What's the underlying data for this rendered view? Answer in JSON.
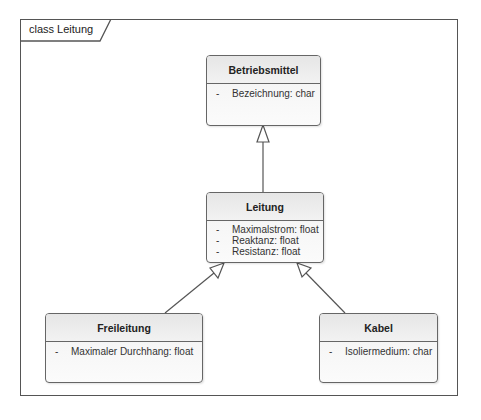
{
  "frame": {
    "label": "class Leitung"
  },
  "classes": {
    "betriebsmittel": {
      "name": "Betriebsmittel",
      "attributes": [
        {
          "visibility": "-",
          "text": "Bezeichnung: char"
        }
      ]
    },
    "leitung": {
      "name": "Leitung",
      "attributes": [
        {
          "visibility": "-",
          "text": "Maximalstrom: float"
        },
        {
          "visibility": "-",
          "text": "Reaktanz: float"
        },
        {
          "visibility": "-",
          "text": "Resistanz: float"
        }
      ]
    },
    "freileitung": {
      "name": "Freileitung",
      "attributes": [
        {
          "visibility": "-",
          "text": "Maximaler Durchhang: float"
        }
      ]
    },
    "kabel": {
      "name": "Kabel",
      "attributes": [
        {
          "visibility": "-",
          "text": "Isoliermedium: char"
        }
      ]
    }
  },
  "relationships": [
    {
      "type": "generalization",
      "from": "Leitung",
      "to": "Betriebsmittel"
    },
    {
      "type": "generalization",
      "from": "Freileitung",
      "to": "Leitung"
    },
    {
      "type": "generalization",
      "from": "Kabel",
      "to": "Leitung"
    }
  ],
  "colors": {
    "border": "#666666",
    "frame": "#555555",
    "fill_top": "#ececec",
    "fill_bottom": "#fbfbfb"
  }
}
